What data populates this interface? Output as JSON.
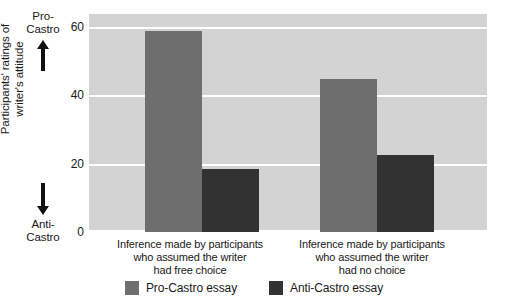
{
  "chart_data": {
    "type": "bar",
    "title": "",
    "xlabel": "",
    "ylabel": "Participants' ratings of writer's attitude",
    "ylim": [
      0,
      64
    ],
    "yticks": [
      0,
      20,
      40,
      60
    ],
    "ytick_labels": [
      "0",
      "20",
      "40",
      "60"
    ],
    "grid": true,
    "legend_position": "bottom-center",
    "categories": [
      "Inference made by participants who assumed the writer had free choice",
      "Inference made by participants who assumed the writer had no choice"
    ],
    "series": [
      {
        "name": "Pro-Castro essay",
        "color": "#6e6e6e",
        "values": [
          59,
          45
        ]
      },
      {
        "name": "Anti-Castro essay",
        "color": "#323232",
        "values": [
          18.5,
          22.5
        ]
      }
    ]
  },
  "axis": {
    "top_pole_line1": "Pro-",
    "top_pole_line2": "Castro",
    "bottom_pole_line1": "Anti-",
    "bottom_pole_line2": "Castro",
    "y_title_line1": "Participants' ratings of",
    "y_title_line2": "writer's attitude",
    "tick_60": "60",
    "tick_40": "40",
    "tick_20": "20",
    "tick_0": "0"
  },
  "categories_display": {
    "group1_line1": "Inference made by participants",
    "group1_line2": "who assumed the writer",
    "group1_line3": "had free choice",
    "group2_line1": "Inference made by participants",
    "group2_line2": "who assumed the writer",
    "group2_line3": "had no choice"
  },
  "legend": {
    "item1_label": "Pro-Castro essay",
    "item2_label": "Anti-Castro essay"
  },
  "colors": {
    "plot_background": "#d3d3d3",
    "gridline": "#ffffff",
    "pro_castro": "#6e6e6e",
    "anti_castro": "#323232",
    "text": "#1a1a1a"
  }
}
